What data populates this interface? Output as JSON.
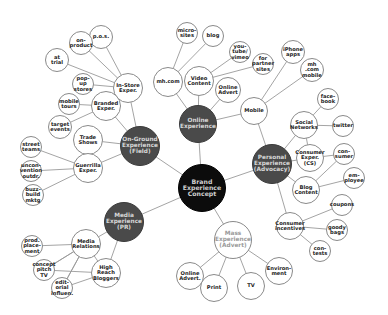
{
  "diagram": {
    "type": "mind-map",
    "colors": {
      "root": "#0c0c0c",
      "hub": "#4a4a4a",
      "leaf_border": "#8a8a8a",
      "link": "#9a9a9a"
    },
    "root": {
      "id": "brand",
      "label": "Brand\nExperience\nConcept",
      "x": 202,
      "y": 188,
      "r": 24
    },
    "hubs": [
      {
        "id": "onground",
        "label": "On-Ground\nExperience\n(Field)",
        "x": 140,
        "y": 146,
        "r": 20
      },
      {
        "id": "online",
        "label": "Online\nExperience",
        "x": 198,
        "y": 124,
        "r": 19
      },
      {
        "id": "personal",
        "label": "Personal\nExperience\n(Advocacy)",
        "x": 272,
        "y": 164,
        "r": 20
      },
      {
        "id": "media",
        "label": "Media\nExperience\n(PR)",
        "x": 124,
        "y": 222,
        "r": 20
      },
      {
        "id": "mass",
        "label": "Mass\nExperience\n(Advert)",
        "x": 233,
        "y": 240,
        "r": 19,
        "style": "white"
      }
    ],
    "leaves": [
      {
        "id": "instore",
        "parent": "onground",
        "label": "In-Store\nExper.",
        "x": 128,
        "y": 88,
        "r": 15
      },
      {
        "id": "pos",
        "parent": "instore",
        "label": "p.o.s.",
        "x": 101,
        "y": 37,
        "r": 12
      },
      {
        "id": "onproduct",
        "parent": "instore",
        "label": "on-\nproduct",
        "x": 81,
        "y": 43,
        "r": 12
      },
      {
        "id": "attrial",
        "parent": "instore",
        "label": "at\ntrial",
        "x": 57,
        "y": 60,
        "r": 12
      },
      {
        "id": "popup",
        "parent": "instore",
        "label": "pop-up\nstores",
        "x": 83,
        "y": 84,
        "r": 11
      },
      {
        "id": "branded",
        "parent": "onground",
        "label": "Branded\nExper.",
        "x": 106,
        "y": 106,
        "r": 15
      },
      {
        "id": "mobiletours",
        "parent": "branded",
        "label": "mobile\ntours",
        "x": 69,
        "y": 104,
        "r": 11
      },
      {
        "id": "targetevents",
        "parent": "branded",
        "label": "target\nevents",
        "x": 60,
        "y": 127,
        "r": 12
      },
      {
        "id": "tradeshows",
        "parent": "onground",
        "label": "Trade\nShows",
        "x": 88,
        "y": 140,
        "r": 15
      },
      {
        "id": "guerrilla",
        "parent": "onground",
        "label": "Guerrilla\nExper.",
        "x": 88,
        "y": 168,
        "r": 15
      },
      {
        "id": "streetteams",
        "parent": "guerrilla",
        "label": "street\nteams",
        "x": 31,
        "y": 147,
        "r": 11
      },
      {
        "id": "unconvention",
        "parent": "guerrilla",
        "label": "uncon-\nvention\noutdr.",
        "x": 31,
        "y": 171,
        "r": 11
      },
      {
        "id": "buzz",
        "parent": "guerrilla",
        "label": "buzz-\nbuild\nmktg",
        "x": 33,
        "y": 195,
        "r": 11
      },
      {
        "id": "mhcom",
        "parent": "online",
        "label": "mh.com",
        "x": 168,
        "y": 82,
        "r": 15
      },
      {
        "id": "microsites",
        "parent": "mhcom",
        "label": "micro-\nsites",
        "x": 187,
        "y": 33,
        "r": 11
      },
      {
        "id": "blog",
        "parent": "mhcom",
        "label": "blog",
        "x": 213,
        "y": 36,
        "r": 11
      },
      {
        "id": "video",
        "parent": "online",
        "label": "Video\nContent",
        "x": 199,
        "y": 81,
        "r": 15
      },
      {
        "id": "youtube",
        "parent": "video",
        "label": "you-\ntube/\nvimeo",
        "x": 240,
        "y": 52,
        "r": 11
      },
      {
        "id": "partnersites",
        "parent": "video",
        "label": "for\npartner\nsites",
        "x": 263,
        "y": 64,
        "r": 11
      },
      {
        "id": "onlineadvert",
        "parent": "online",
        "label": "Online\nAdvert",
        "x": 228,
        "y": 90,
        "r": 13
      },
      {
        "id": "mobile",
        "parent": "online",
        "label": "Mobile",
        "x": 254,
        "y": 111,
        "r": 14
      },
      {
        "id": "iphone",
        "parent": "mobile",
        "label": "iPhone\napps",
        "x": 293,
        "y": 52,
        "r": 12
      },
      {
        "id": "mhmobile",
        "parent": "mobile",
        "label": "mh\n.com\nmobile",
        "x": 312,
        "y": 70,
        "r": 12
      },
      {
        "id": "social",
        "parent": "personal",
        "label": "Social\nNetworks",
        "x": 304,
        "y": 125,
        "r": 14
      },
      {
        "id": "facebook",
        "parent": "social",
        "label": "face-\nbook",
        "x": 328,
        "y": 99,
        "r": 11
      },
      {
        "id": "twitter",
        "parent": "social",
        "label": "twitter",
        "x": 343,
        "y": 126,
        "r": 11
      },
      {
        "id": "consumerexp",
        "parent": "personal",
        "label": "Consumer\nExper.\n(CS)",
        "x": 310,
        "y": 158,
        "r": 14
      },
      {
        "id": "consumer",
        "parent": "blogcontent",
        "label": "con-\nsumer",
        "x": 344,
        "y": 154,
        "r": 11
      },
      {
        "id": "blogcontent",
        "parent": "personal",
        "label": "Blog\nContent",
        "x": 306,
        "y": 190,
        "r": 14
      },
      {
        "id": "employee",
        "parent": "blogcontent",
        "label": "em-\nployee",
        "x": 354,
        "y": 178,
        "r": 11
      },
      {
        "id": "incentives",
        "parent": "personal",
        "label": "Consumer\nincentives",
        "x": 290,
        "y": 226,
        "r": 14
      },
      {
        "id": "coupons",
        "parent": "incentives",
        "label": "coupons",
        "x": 342,
        "y": 205,
        "r": 11
      },
      {
        "id": "goodybags",
        "parent": "incentives",
        "label": "goody\nbags",
        "x": 337,
        "y": 230,
        "r": 11
      },
      {
        "id": "contests",
        "parent": "incentives",
        "label": "con-\ntests",
        "x": 320,
        "y": 251,
        "r": 11
      },
      {
        "id": "mediarel",
        "parent": "media",
        "label": "Media\nRelations",
        "x": 86,
        "y": 244,
        "r": 15
      },
      {
        "id": "prodplacement",
        "parent": "mediarel",
        "label": "prod.\nplace-\nment",
        "x": 32,
        "y": 246,
        "r": 11
      },
      {
        "id": "conceptpitch",
        "parent": "mediarel",
        "label": "concept\npitch\nTV",
        "x": 44,
        "y": 270,
        "r": 11
      },
      {
        "id": "editorial",
        "parent": "mediarel",
        "label": "edit-\norial\ninfluen.",
        "x": 62,
        "y": 288,
        "r": 11
      },
      {
        "id": "highreach",
        "parent": "media",
        "label": "High\nReach\nBloggers",
        "x": 106,
        "y": 273,
        "r": 15
      },
      {
        "id": "onlineadvert2",
        "parent": "mass",
        "label": "Online\nAdvert.",
        "x": 190,
        "y": 276,
        "r": 14
      },
      {
        "id": "print",
        "parent": "mass",
        "label": "Print",
        "x": 214,
        "y": 288,
        "r": 14
      },
      {
        "id": "tv",
        "parent": "mass",
        "label": "TV",
        "x": 251,
        "y": 286,
        "r": 14
      },
      {
        "id": "environment",
        "parent": "mass",
        "label": "Environ-\nment",
        "x": 279,
        "y": 271,
        "r": 14
      }
    ],
    "extra_links": [
      [
        "mediarel",
        "highreach"
      ],
      [
        "conceptpitch",
        "highreach"
      ],
      [
        "editorial",
        "highreach"
      ],
      [
        "editorial",
        "mediarel"
      ],
      [
        "conceptpitch",
        "mediarel"
      ],
      [
        "social",
        "consumerexp"
      ],
      [
        "consumer",
        "consumerexp"
      ],
      [
        "mobile",
        "personal"
      ]
    ]
  }
}
